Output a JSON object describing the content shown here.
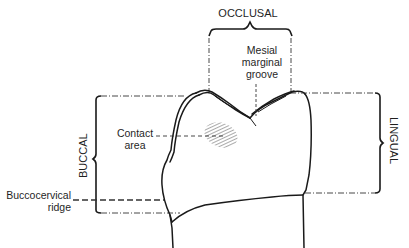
{
  "diagram": {
    "type": "dental-anatomy-illustration",
    "colors": {
      "line": "#1a1a1a",
      "background": "#ffffff",
      "hatch": "#555555"
    }
  },
  "labels": {
    "occlusal": "OCCLUSAL",
    "mesial_marginal_groove": [
      "Mesial",
      "marginal",
      "groove"
    ],
    "contact_area": [
      "Contact",
      "area"
    ],
    "buccal": "BUCCAL",
    "lingual": "LINGUAL",
    "buccocervical_ridge": [
      "Buccocervical",
      "ridge"
    ]
  }
}
